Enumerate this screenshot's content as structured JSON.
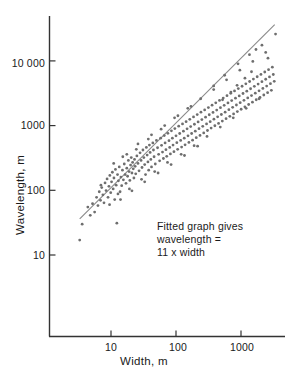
{
  "chart_data": {
    "type": "scatter",
    "title": "",
    "xlabel": "Width, m",
    "ylabel": "Wavelength, m",
    "xscale": "log",
    "yscale": "log",
    "xlim": [
      3.2,
      3800
    ],
    "ylim": [
      9.0,
      42000
    ],
    "grid": false,
    "legend": null,
    "xticks": [
      10,
      100,
      1000
    ],
    "xtick_labels": [
      "10",
      "100",
      "1000"
    ],
    "yticks": [
      100,
      1000,
      10000
    ],
    "ytick_labels": [
      "100",
      "1000",
      "10 000"
    ],
    "extra_ytick": {
      "value": 10,
      "label": "10"
    },
    "marker": {
      "shape": "circle",
      "size_px": 1.9,
      "color": "#6e6e6e"
    },
    "annotations": [
      {
        "lines": [
          "Fitted graph gives",
          "wavelength =",
          "11 x width"
        ],
        "x_px": 157,
        "y_px": 224
      }
    ],
    "fit_line": {
      "relation": "wavelength = 11 x width",
      "slope": 1.0,
      "intercept_multiplier": 11,
      "color": "#8a8a8a",
      "x_start": 3.3,
      "x_end": 3300
    },
    "points": [
      [
        3.3,
        17
      ],
      [
        3.6,
        30
      ],
      [
        4.4,
        55
      ],
      [
        4.8,
        41
      ],
      [
        5.2,
        62
      ],
      [
        5.6,
        46
      ],
      [
        6.0,
        78
      ],
      [
        6.3,
        58
      ],
      [
        6.6,
        95
      ],
      [
        6.9,
        70
      ],
      [
        7.2,
        110
      ],
      [
        7.5,
        85
      ],
      [
        7.8,
        64
      ],
      [
        8.1,
        130
      ],
      [
        8.4,
        99
      ],
      [
        8.7,
        150
      ],
      [
        9.0,
        78
      ],
      [
        9.3,
        115
      ],
      [
        9.6,
        170
      ],
      [
        9.9,
        92
      ],
      [
        10.2,
        135
      ],
      [
        10.5,
        190
      ],
      [
        10.8,
        105
      ],
      [
        11.1,
        155
      ],
      [
        11.4,
        72
      ],
      [
        11.7,
        210
      ],
      [
        12.0,
        120
      ],
      [
        12.3,
        31
      ],
      [
        12.6,
        175
      ],
      [
        13.0,
        140
      ],
      [
        13.4,
        230
      ],
      [
        13.8,
        95
      ],
      [
        14.2,
        160
      ],
      [
        14.6,
        118
      ],
      [
        15.0,
        205
      ],
      [
        15.5,
        145
      ],
      [
        16.0,
        255
      ],
      [
        16.5,
        175
      ],
      [
        17.0,
        128
      ],
      [
        17.5,
        220
      ],
      [
        18.0,
        165
      ],
      [
        18.5,
        290
      ],
      [
        19.0,
        195
      ],
      [
        19.5,
        142
      ],
      [
        20.0,
        245
      ],
      [
        20.5,
        320
      ],
      [
        21.0,
        185
      ],
      [
        21.5,
        270
      ],
      [
        22.0,
        215
      ],
      [
        22.5,
        155
      ],
      [
        23.0,
        300
      ],
      [
        23.5,
        235
      ],
      [
        24.0,
        180
      ],
      [
        25.0,
        340
      ],
      [
        26.0,
        260
      ],
      [
        27.0,
        200
      ],
      [
        28.0,
        380
      ],
      [
        29.0,
        290
      ],
      [
        30.0,
        225
      ],
      [
        31.0,
        420
      ],
      [
        32.0,
        320
      ],
      [
        33.0,
        250
      ],
      [
        34.0,
        175
      ],
      [
        35.0,
        460
      ],
      [
        36.0,
        350
      ],
      [
        37.0,
        275
      ],
      [
        38.0,
        205
      ],
      [
        39.0,
        500
      ],
      [
        40.0,
        385
      ],
      [
        41.0,
        300
      ],
      [
        42.0,
        230
      ],
      [
        44.0,
        540
      ],
      [
        45.0,
        420
      ],
      [
        46.0,
        330
      ],
      [
        48.0,
        255
      ],
      [
        50.0,
        590
      ],
      [
        52.0,
        455
      ],
      [
        54.0,
        360
      ],
      [
        56.0,
        285
      ],
      [
        58.0,
        640
      ],
      [
        60.0,
        495
      ],
      [
        62.0,
        390
      ],
      [
        64.0,
        310
      ],
      [
        66.0,
        700
      ],
      [
        68.0,
        540
      ],
      [
        70.0,
        425
      ],
      [
        72.0,
        335
      ],
      [
        75.0,
        760
      ],
      [
        78.0,
        585
      ],
      [
        80.0,
        460
      ],
      [
        82.0,
        365
      ],
      [
        85.0,
        830
      ],
      [
        88.0,
        640
      ],
      [
        90.0,
        500
      ],
      [
        93.0,
        395
      ],
      [
        96.0,
        900
      ],
      [
        100.0,
        695
      ],
      [
        103.0,
        545
      ],
      [
        106.0,
        430
      ],
      [
        110.0,
        980
      ],
      [
        114.0,
        755
      ],
      [
        118.0,
        590
      ],
      [
        122.0,
        465
      ],
      [
        126.0,
        1060
      ],
      [
        130.0,
        820
      ],
      [
        134.0,
        640
      ],
      [
        138.0,
        505
      ],
      [
        143.0,
        1150
      ],
      [
        148.0,
        890
      ],
      [
        153.0,
        695
      ],
      [
        158.0,
        550
      ],
      [
        163.0,
        1250
      ],
      [
        168.0,
        965
      ],
      [
        174.0,
        755
      ],
      [
        180.0,
        595
      ],
      [
        186.0,
        1360
      ],
      [
        192.0,
        1050
      ],
      [
        198.0,
        820
      ],
      [
        205.0,
        650
      ],
      [
        212.0,
        1480
      ],
      [
        219.0,
        1140
      ],
      [
        226.0,
        895
      ],
      [
        234.0,
        705
      ],
      [
        242.0,
        1610
      ],
      [
        250.0,
        1240
      ],
      [
        258.0,
        975
      ],
      [
        267.0,
        770
      ],
      [
        276.0,
        1750
      ],
      [
        285.0,
        1350
      ],
      [
        295.0,
        1060
      ],
      [
        305.0,
        840
      ],
      [
        315.0,
        1900
      ],
      [
        325.0,
        1470
      ],
      [
        336.0,
        1150
      ],
      [
        347.0,
        915
      ],
      [
        359.0,
        2070
      ],
      [
        371.0,
        1600
      ],
      [
        383.0,
        1255
      ],
      [
        396.0,
        995
      ],
      [
        409.0,
        2250
      ],
      [
        423.0,
        1740
      ],
      [
        437.0,
        1365
      ],
      [
        452.0,
        1080
      ],
      [
        467.0,
        2450
      ],
      [
        483.0,
        1890
      ],
      [
        499.0,
        1485
      ],
      [
        516.0,
        1175
      ],
      [
        533.0,
        2660
      ],
      [
        551.0,
        2060
      ],
      [
        570.0,
        1615
      ],
      [
        589.0,
        1280
      ],
      [
        609.0,
        2900
      ],
      [
        630.0,
        2240
      ],
      [
        651.0,
        1760
      ],
      [
        673.0,
        1390
      ],
      [
        696.0,
        3150
      ],
      [
        719.0,
        2440
      ],
      [
        744.0,
        1915
      ],
      [
        769.0,
        1515
      ],
      [
        795.0,
        3430
      ],
      [
        822.0,
        2650
      ],
      [
        850.0,
        2080
      ],
      [
        879.0,
        1650
      ],
      [
        909.0,
        3730
      ],
      [
        940.0,
        2880
      ],
      [
        972.0,
        2265
      ],
      [
        1005.0,
        1790
      ],
      [
        1039.0,
        4060
      ],
      [
        1074.0,
        3135
      ],
      [
        1111.0,
        2460
      ],
      [
        1148.0,
        1950
      ],
      [
        1187.0,
        4420
      ],
      [
        1228.0,
        3410
      ],
      [
        1269.0,
        2680
      ],
      [
        1312.0,
        2120
      ],
      [
        1357.0,
        4800
      ],
      [
        1403.0,
        3710
      ],
      [
        1451.0,
        2915
      ],
      [
        1500.0,
        2305
      ],
      [
        1551.0,
        5230
      ],
      [
        1604.0,
        4040
      ],
      [
        1659.0,
        3170
      ],
      [
        1715.0,
        2510
      ],
      [
        1774.0,
        5690
      ],
      [
        1834.0,
        4390
      ],
      [
        1897.0,
        3450
      ],
      [
        1961.0,
        2730
      ],
      [
        2028.0,
        6190
      ],
      [
        2098.0,
        4780
      ],
      [
        2169.0,
        3755
      ],
      [
        2243.0,
        2970
      ],
      [
        2320.0,
        6740
      ],
      [
        2399.0,
        5200
      ],
      [
        2481.0,
        4085
      ],
      [
        2566.0,
        3230
      ],
      [
        2654.0,
        7330
      ],
      [
        2744.0,
        5660
      ],
      [
        2838.0,
        4445
      ],
      [
        2935.0,
        3515
      ],
      [
        3035.0,
        8000
      ],
      [
        3139.0,
        6160
      ],
      [
        3246.0,
        4840
      ],
      [
        3400.0,
        26000
      ],
      [
        7.0,
        120
      ],
      [
        9.5,
        60
      ],
      [
        12.8,
        88
      ],
      [
        15.2,
        330
      ],
      [
        19.2,
        105
      ],
      [
        24.5,
        430
      ],
      [
        29.5,
        148
      ],
      [
        37.5,
        620
      ],
      [
        47.0,
        195
      ],
      [
        59.0,
        880
      ],
      [
        74.0,
        270
      ],
      [
        95.0,
        1320
      ],
      [
        120.0,
        360
      ],
      [
        152.0,
        1850
      ],
      [
        190.0,
        490
      ],
      [
        240.0,
        2600
      ],
      [
        300.0,
        680
      ],
      [
        380.0,
        3600
      ],
      [
        480.0,
        950
      ],
      [
        600.0,
        5100
      ],
      [
        760.0,
        1320
      ],
      [
        960.0,
        7200
      ],
      [
        1200.0,
        1850
      ],
      [
        1520.0,
        9800
      ],
      [
        1900.0,
        2600
      ],
      [
        2400.0,
        13500
      ],
      [
        380.0,
        4100
      ],
      [
        560.0,
        6000
      ],
      [
        900.0,
        9000
      ],
      [
        1350.0,
        12500
      ],
      [
        1700.0,
        15000
      ],
      [
        2100.0,
        17500
      ],
      [
        2600.0,
        11000
      ],
      [
        1450.0,
        6800
      ],
      [
        1150.0,
        5400
      ],
      [
        870.0,
        4200
      ],
      [
        700.0,
        3300
      ],
      [
        520.0,
        2500
      ],
      [
        11.0,
        260
      ],
      [
        14.0,
        72
      ],
      [
        17.5,
        360
      ],
      [
        21.0,
        98
      ],
      [
        26.0,
        520
      ],
      [
        33.0,
        135
      ],
      [
        42.0,
        720
      ],
      [
        53.0,
        185
      ],
      [
        67.0,
        1000
      ],
      [
        84.0,
        250
      ],
      [
        107.0,
        1420
      ],
      [
        135.0,
        345
      ],
      [
        170.0,
        1980
      ],
      [
        215.0,
        480
      ]
    ]
  }
}
